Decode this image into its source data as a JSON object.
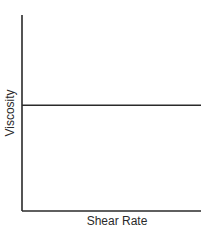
{
  "chart_data": {
    "type": "line",
    "title": "",
    "xlabel": "Shear Rate",
    "ylabel": "Viscosity",
    "xlim": [
      0,
      1
    ],
    "ylim": [
      0,
      1
    ],
    "grid": false,
    "legend": null,
    "x_ticks": [],
    "y_ticks": [],
    "series": [
      {
        "name": "constant viscosity",
        "x": [
          0,
          1
        ],
        "y": [
          0.54,
          0.54
        ],
        "color": "#2a2a2a"
      }
    ]
  }
}
